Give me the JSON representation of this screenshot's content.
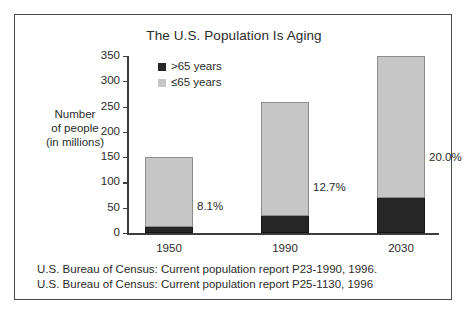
{
  "chart_data": {
    "type": "bar",
    "subtype": "stacked-bar",
    "title": "The U.S. Population Is Aging",
    "xlabel": "",
    "ylabel": "Number of people (in millions)",
    "ylim": [
      0,
      350
    ],
    "yticks": [
      0,
      50,
      100,
      150,
      200,
      250,
      300,
      350
    ],
    "ytick_labels": [
      "0",
      "50",
      "100",
      "150",
      "200",
      "250",
      "300",
      "350"
    ],
    "grid": false,
    "legend_position": "top-left inside plot",
    "categories": [
      "1950",
      "1990",
      "2030"
    ],
    "series": [
      {
        "name": ">65 years",
        "color": "#262626",
        "values": [
          12,
          33,
          70
        ]
      },
      {
        "name": "≤65 years",
        "color": "#c6c6c6",
        "values": [
          138,
          227,
          280
        ]
      }
    ],
    "totals": [
      150,
      260,
      350
    ],
    "annotations": [
      "8.1%",
      "12.7%",
      "20.0%"
    ]
  },
  "figure": {
    "title": "The U.S. Population Is Aging",
    "y_axis_caption_line1": "Number",
    "y_axis_caption_line2": "of people",
    "y_axis_caption_line3": "(in millions)"
  },
  "legend": {
    "items": [
      {
        "label": ">65 years",
        "color": "#262626",
        "swatch_name": "legend-swatch-over-65"
      },
      {
        "label": "≤65 years",
        "color": "#c6c6c6",
        "swatch_name": "legend-swatch-under-65"
      }
    ]
  },
  "axis": {
    "y_ticks": [
      {
        "label": "350",
        "value": 350
      },
      {
        "label": "300",
        "value": 300
      },
      {
        "label": "250",
        "value": 250
      },
      {
        "label": "200",
        "value": 200
      },
      {
        "label": "150",
        "value": 150
      },
      {
        "label": "100",
        "value": 100
      },
      {
        "label": "50",
        "value": 50
      },
      {
        "label": "0",
        "value": 0
      }
    ],
    "x_categories": [
      "1950",
      "1990",
      "2030"
    ]
  },
  "bars": [
    {
      "category": "1950",
      "total": 150,
      "over65": 12,
      "under65": 138,
      "pct_label": "8.1%"
    },
    {
      "category": "1990",
      "total": 260,
      "over65": 33,
      "under65": 227,
      "pct_label": "12.7%"
    },
    {
      "category": "2030",
      "total": 350,
      "over65": 70,
      "under65": 280,
      "pct_label": "20.0%"
    }
  ],
  "sources": {
    "line1": "U.S. Bureau of Census: Current population report P23-1990, 1996.",
    "line2": "U.S. Bureau of Census: Current population report P25-1130, 1996"
  },
  "colors": {
    "over65_fill": "#262626",
    "under65_fill": "#c6c6c6",
    "axis": "#3d3d3d",
    "border": "#4a4a4a",
    "text": "#2b2b2b",
    "background": "#ffffff"
  }
}
